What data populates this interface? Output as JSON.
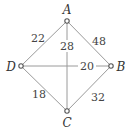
{
  "graph": {
    "vertices": [
      {
        "id": "A",
        "label": "A",
        "x": 67,
        "y": 21
      },
      {
        "id": "B",
        "label": "B",
        "x": 111,
        "y": 66
      },
      {
        "id": "C",
        "label": "C",
        "x": 67,
        "y": 111
      },
      {
        "id": "D",
        "label": "D",
        "x": 21,
        "y": 66
      }
    ],
    "edges": [
      {
        "from": "A",
        "to": "D",
        "weight": "22"
      },
      {
        "from": "A",
        "to": "B",
        "weight": "48"
      },
      {
        "from": "A",
        "to": "C",
        "weight": "28"
      },
      {
        "from": "D",
        "to": "B",
        "weight": "20"
      },
      {
        "from": "D",
        "to": "C",
        "weight": "18"
      },
      {
        "from": "B",
        "to": "C",
        "weight": "32"
      }
    ]
  }
}
